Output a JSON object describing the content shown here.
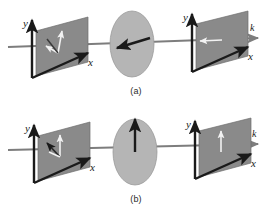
{
  "figure": {
    "background_color": "#ffffff",
    "panel_fill": "#8a8a8a",
    "panel_stroke": "#6e6e6e",
    "ellipse_fill": "#b5b5b5",
    "ellipse_stroke": "#9a9a9a",
    "axis_color": "#1a1a1a",
    "beam_color": "#7d7d7d",
    "field_white": "#f2f2f2",
    "field_dark": "#1a1a1a"
  },
  "subfigures": [
    {
      "id": "a",
      "caption": "(a)",
      "left_plane": {
        "labels": {
          "y": "y",
          "x": "x"
        },
        "field_arrow": {
          "name": "incident-field-arrow",
          "color": "white",
          "direction": "up-right",
          "angle_deg": 75
        },
        "second_arrow": {
          "name": "incident-field-component-arrow",
          "color": "white",
          "direction": "down-left",
          "angle_deg": 200
        }
      },
      "polarizer": {
        "name": "polarizer-ellipse",
        "axis_arrow": {
          "name": "polarizer-axis-arrow",
          "color": "dark",
          "direction": "left-down",
          "angle_deg": 190
        }
      },
      "right_plane": {
        "labels": {
          "y": "y",
          "x": "x",
          "k": "k"
        },
        "field_arrow": {
          "name": "transmitted-field-arrow",
          "color": "white",
          "direction": "left",
          "angle_deg": 180
        }
      }
    },
    {
      "id": "b",
      "caption": "(b)",
      "left_plane": {
        "labels": {
          "y": "y",
          "x": "x"
        },
        "field_arrow": {
          "name": "incident-field-arrow",
          "color": "white",
          "direction": "up",
          "angle_deg": 90
        },
        "second_arrow": {
          "name": "incident-field-component-arrow",
          "color": "dark",
          "direction": "down-left",
          "angle_deg": 215
        }
      },
      "polarizer": {
        "name": "polarizer-ellipse",
        "axis_arrow": {
          "name": "polarizer-axis-arrow",
          "color": "dark",
          "direction": "up",
          "angle_deg": 90
        }
      },
      "right_plane": {
        "labels": {
          "y": "y",
          "x": "x",
          "k": "k"
        },
        "field_arrow": {
          "name": "transmitted-field-arrow",
          "color": "white",
          "direction": "up",
          "angle_deg": 90
        }
      }
    }
  ],
  "axis_labels": {
    "y": "y",
    "x": "x",
    "k": "k"
  }
}
